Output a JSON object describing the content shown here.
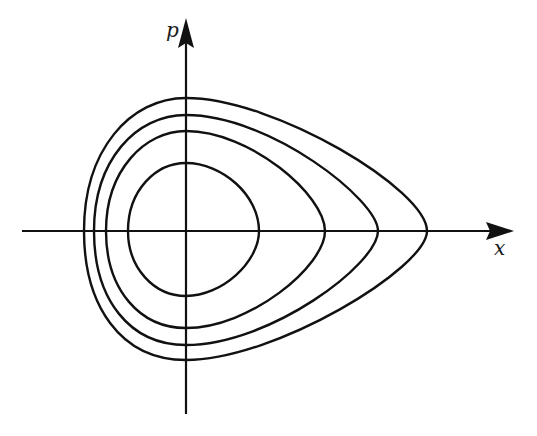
{
  "diagram": {
    "type": "phase portrait",
    "axes": {
      "x_label": "x",
      "y_label": "p",
      "origin_px": [
        186,
        231
      ]
    },
    "curves": [
      {
        "name": "orbit-1",
        "x_left": 128,
        "x_right": 259,
        "p_top": 163,
        "p_bottom": 296
      },
      {
        "name": "orbit-2",
        "x_left": 106,
        "x_right": 325,
        "p_top": 131,
        "p_bottom": 328
      },
      {
        "name": "orbit-3",
        "x_left": 94,
        "x_right": 378,
        "p_top": 115,
        "p_bottom": 345
      },
      {
        "name": "orbit-4",
        "x_left": 84,
        "x_right": 427,
        "p_top": 98,
        "p_bottom": 360
      }
    ],
    "colors": {
      "stroke": "#111111",
      "background": "#ffffff"
    }
  }
}
